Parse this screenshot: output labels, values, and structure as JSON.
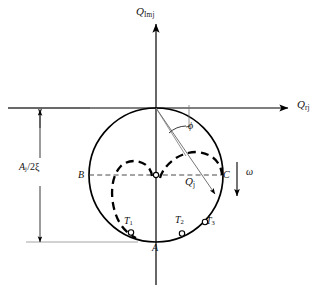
{
  "figure": {
    "kind": "phasor-circle-diagram",
    "background_color": "#ffffff",
    "stroke_color": "#000000",
    "dashed_color": "#000000",
    "guide_color": "#808080"
  },
  "axes": {
    "y_label_base": "Q",
    "y_label_sub": "Imj",
    "x_label_base": "Q",
    "x_label_sub": "rj",
    "origin": {
      "x": 156,
      "y": 108
    }
  },
  "annotations": {
    "amplitude_base": "A",
    "amplitude_sub": "j",
    "amplitude_tail": "/2ξ",
    "point_b": "B",
    "point_c": "C",
    "point_a": "A",
    "vector_base": "Q",
    "vector_sub": "j",
    "angle": "ϕ",
    "omega": "ω"
  },
  "markers": [
    {
      "label_base": "T",
      "label_sub": "1",
      "x": 131,
      "y": 232.5
    },
    {
      "label_base": "T",
      "label_sub": "2",
      "x": 182,
      "y": 233.5
    },
    {
      "label_base": "T",
      "label_sub": "3",
      "x": 205,
      "y": 222
    }
  ],
  "circle": {
    "cx": 156,
    "cy": 175,
    "r": 67
  }
}
